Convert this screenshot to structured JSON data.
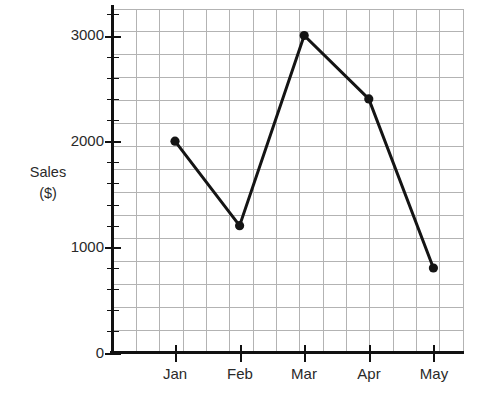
{
  "chart_data": {
    "type": "line",
    "title": "",
    "xlabel": "",
    "ylabel": "Sales\n($)",
    "ylabel_line1": "Sales",
    "ylabel_line2": "($)",
    "categories": [
      "Jan",
      "Feb",
      "Mar",
      "Apr",
      "May"
    ],
    "values": [
      2000,
      1200,
      3000,
      2400,
      800
    ],
    "series": [
      {
        "name": "Sales",
        "values": [
          2000,
          1200,
          3000,
          2400,
          800
        ]
      }
    ],
    "points": [
      {
        "x": "Jan",
        "y": 2000
      },
      {
        "x": "Feb",
        "y": 1200
      },
      {
        "x": "Mar",
        "y": 3000
      },
      {
        "x": "Apr",
        "y": 2400
      },
      {
        "x": "May",
        "y": 800
      }
    ],
    "ylim": [
      0,
      3255
    ],
    "y_ticks_major": [
      0,
      1000,
      2000,
      3000
    ],
    "y_tick_labels": [
      "0",
      "1000",
      "2000",
      "3000"
    ],
    "y_minor_step": 200,
    "x_tick_labels": [
      "Jan",
      "Feb",
      "Mar",
      "Apr",
      "May"
    ],
    "grid": true,
    "grid_columns": 15,
    "grid_rows": 15,
    "legend": false,
    "legend_position": "none",
    "marker": "circle",
    "colors": {
      "line": "#141414",
      "marker": "#141414",
      "grid": "#b3b3b3",
      "axis": "#111111",
      "text": "#2a2a2a",
      "background": "#ffffff"
    }
  },
  "labels": {
    "y_axis_title_line1": "Sales",
    "y_axis_title_line2": "($)",
    "y_0": "0",
    "y_1000": "1000",
    "y_2000": "2000",
    "y_3000": "3000",
    "x_jan": "Jan",
    "x_feb": "Feb",
    "x_mar": "Mar",
    "x_apr": "Apr",
    "x_may": "May"
  }
}
